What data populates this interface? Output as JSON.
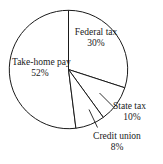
{
  "chart_data": {
    "type": "pie",
    "title": "",
    "subtitle": "",
    "xlabel": "",
    "ylabel": "",
    "legend": "none",
    "grid": false,
    "start_angle_deg": 0,
    "direction": "clockwise",
    "units": "percent",
    "categories": [
      "Federal tax",
      "State tax",
      "Credit union",
      "Take-home pay"
    ],
    "values": [
      30,
      10,
      8,
      52
    ],
    "labels": [
      "30%",
      "10%",
      "8%",
      "52%"
    ],
    "slices": [
      {
        "name": "Federal tax",
        "value": 30,
        "label": "30%",
        "label_placement": "inside",
        "leader_line": false,
        "start_deg": 0,
        "end_deg": 108,
        "fill": "#ffffff",
        "stroke": "#1a1a1a"
      },
      {
        "name": "State tax",
        "value": 10,
        "label": "10%",
        "label_placement": "outside",
        "leader_line": true,
        "start_deg": 108,
        "end_deg": 144,
        "fill": "#ffffff",
        "stroke": "#1a1a1a"
      },
      {
        "name": "Credit union",
        "value": 8,
        "label": "8%",
        "label_placement": "outside",
        "leader_line": true,
        "start_deg": 144,
        "end_deg": 172.8,
        "fill": "#ffffff",
        "stroke": "#1a1a1a"
      },
      {
        "name": "Take-home pay",
        "value": 52,
        "label": "52%",
        "label_placement": "inside",
        "leader_line": false,
        "start_deg": 172.8,
        "end_deg": 360,
        "fill": "#ffffff",
        "stroke": "#1a1a1a"
      }
    ],
    "colors": {
      "outline": "#1a1a1a",
      "slice_fill": "#ffffff",
      "text": "#1a1a1a",
      "background": "#ffffff"
    }
  },
  "figure": {
    "federal": {
      "name": "Federal tax",
      "percent": "30%"
    },
    "takehome": {
      "name": "Take-home pay",
      "percent": "52%"
    },
    "state": {
      "name": "State tax",
      "percent": "10%"
    },
    "credit": {
      "name": "Credit union",
      "percent": "8%"
    }
  }
}
